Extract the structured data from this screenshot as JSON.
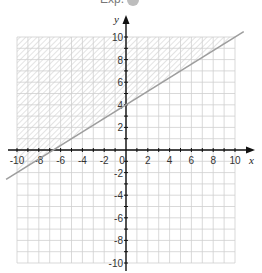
{
  "header": {
    "clipped_text": "Exp."
  },
  "chart_data": {
    "type": "line",
    "title": "",
    "xlabel": "x",
    "ylabel": "y",
    "xlim": [
      -10,
      10
    ],
    "ylim": [
      -10,
      10
    ],
    "grid": true,
    "grid_step": 1,
    "x_ticks": [
      -10,
      -8,
      -6,
      -4,
      -2,
      0,
      2,
      4,
      6,
      8,
      10
    ],
    "y_ticks": [
      -10,
      -8,
      -6,
      -4,
      -2,
      2,
      4,
      6,
      8,
      10
    ],
    "origin_label": "0",
    "series": [
      {
        "name": "boundary line",
        "equation": "y = 0.6x + 4",
        "points": [
          [
            -11,
            -2.6
          ],
          [
            10.8,
            10.48
          ]
        ],
        "color": "#9e9e9e"
      }
    ],
    "shaded_region": {
      "description": "y >= 0.6x + 4",
      "side": "above",
      "pattern": "diagonal-hatch",
      "color": "#c8c8c8"
    },
    "legend": null
  },
  "colors": {
    "grid": "#cfcfcf",
    "axis": "#111111",
    "line": "#9e9e9e",
    "hatch": "#d0d0d0"
  }
}
